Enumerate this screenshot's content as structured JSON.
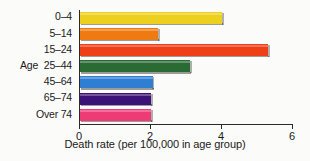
{
  "chart_data": {
    "type": "bar",
    "orientation": "horizontal",
    "title": "",
    "xlabel": "Death rate (per 100,000 in age group)",
    "ylabel": "Age",
    "categories": [
      "0–4",
      "5–14",
      "15–24",
      "25–44",
      "45–64",
      "65–74",
      "Over 74"
    ],
    "values": [
      4.0,
      2.2,
      5.3,
      3.1,
      2.05,
      2.0,
      2.0
    ],
    "colors": [
      "#edd01e",
      "#ef7a12",
      "#ee3f16",
      "#2a6b34",
      "#2e7fd4",
      "#3d1278",
      "#ee3a75"
    ],
    "xlim": [
      0,
      6
    ],
    "xticks": [
      0,
      2,
      4,
      6
    ],
    "xtick_labels": [
      "0",
      "2",
      "4",
      "6"
    ],
    "grid": false,
    "legend": false,
    "background": "#fbfbf9",
    "axis_color": "#2a2a2a"
  }
}
